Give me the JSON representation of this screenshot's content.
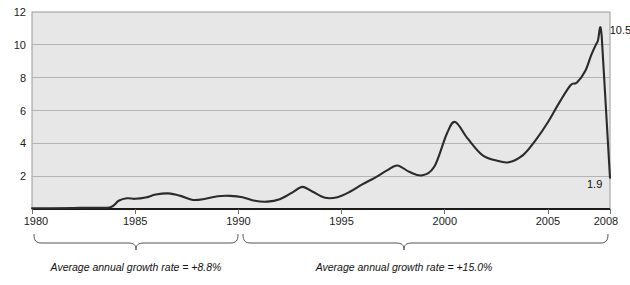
{
  "chart_data": {
    "type": "line",
    "title": "",
    "xlabel": "",
    "ylabel": "",
    "xlim": [
      1980,
      2008
    ],
    "ylim": [
      0,
      12
    ],
    "grid": true,
    "legend": "none",
    "x_ticks": [
      "1980",
      "1985",
      "1990",
      "1995",
      "2000",
      "2005",
      "2008"
    ],
    "y_ticks": [
      "12",
      "10",
      "8",
      "6",
      "4",
      "2"
    ],
    "series": [
      {
        "name": "value",
        "x": [
          1980,
          1981,
          1982,
          1983,
          1983.8,
          1984.2,
          1984.6,
          1985,
          1985.5,
          1986,
          1986.6,
          1987.2,
          1987.8,
          1988.4,
          1989,
          1989.6,
          1990.2,
          1990.8,
          1991.4,
          1992,
          1992.6,
          1993.1,
          1993.6,
          1994.2,
          1994.8,
          1995.4,
          1996,
          1996.6,
          1997.2,
          1997.7,
          1998.3,
          1998.9,
          1999.5,
          2000.1,
          2000.5,
          2001.1,
          2001.8,
          2002.5,
          2003.1,
          2003.8,
          2004.4,
          2005,
          2005.6,
          2006.1,
          2006.4,
          2006.8,
          2007.1,
          2007.4,
          2007.6,
          2008
        ],
        "values": [
          0.05,
          0.05,
          0.06,
          0.08,
          0.1,
          0.5,
          0.65,
          0.62,
          0.7,
          0.88,
          0.95,
          0.8,
          0.55,
          0.62,
          0.78,
          0.8,
          0.72,
          0.5,
          0.45,
          0.6,
          1.0,
          1.35,
          1.05,
          0.68,
          0.72,
          1.05,
          1.5,
          1.9,
          2.35,
          2.65,
          2.25,
          2.05,
          2.6,
          4.6,
          5.3,
          4.3,
          3.3,
          2.95,
          2.85,
          3.3,
          4.2,
          5.3,
          6.6,
          7.55,
          7.7,
          8.4,
          9.4,
          10.2,
          10.5,
          1.9
        ]
      }
    ],
    "point_labels": [
      {
        "name": "peak",
        "text": "10.5",
        "x": 2007.6,
        "y": 10.5
      },
      {
        "name": "endpoint",
        "text": "1.9",
        "x": 2008,
        "y": 1.9
      }
    ],
    "annotations": [
      {
        "name": "growth-rate-period-1",
        "text": "Average annual growth rate = +8.8%",
        "from_year": 1980,
        "to_year": 1990
      },
      {
        "name": "growth-rate-period-2",
        "text": "Average annual growth rate = +15.0%",
        "from_year": 1990,
        "to_year": 2008
      }
    ]
  }
}
